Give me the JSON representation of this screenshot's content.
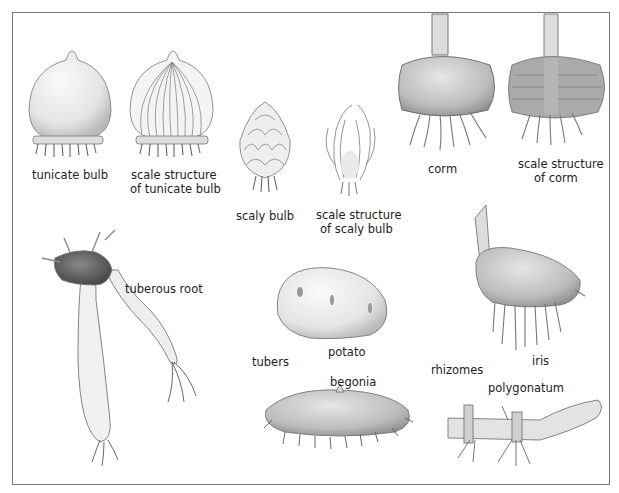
{
  "diagram": {
    "title": "",
    "labels": {
      "tunicate_bulb": "tunicate bulb",
      "tunicate_scale_1": "scale structure",
      "tunicate_scale_2": "of tunicate bulb",
      "scaly_bulb": "scaly bulb",
      "scaly_scale_1": "scale structure",
      "scaly_scale_2": "of  scaly bulb",
      "corm": "corm",
      "corm_scale_1": "scale structure",
      "corm_scale_2": "of corm",
      "tuberous_root": "tuberous root",
      "potato": "potato",
      "tubers": "tubers",
      "begonia": "begonia",
      "rhizomes": "rhizomes",
      "iris": "iris",
      "polygonatum": "polygonatum"
    },
    "colors": {
      "border": "#777777",
      "ink": "#222222",
      "light_fill": "#eeeeee",
      "mid_fill": "#bdbdbd",
      "dark_fill": "#555555"
    }
  }
}
